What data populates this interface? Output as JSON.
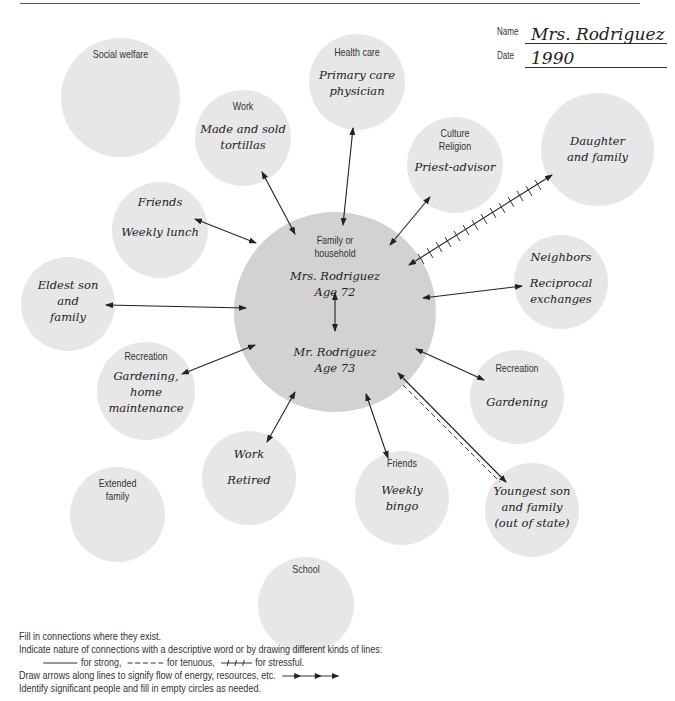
{
  "header": {
    "name_label": "Name",
    "name_value": "Mrs. Rodriguez",
    "date_label": "Date",
    "date_value": "1990"
  },
  "center": {
    "category": "Family or household",
    "person1_name": "Mrs. Rodriguez",
    "person1_age": "Age 72",
    "person2_name": "Mr. Rodriguez",
    "person2_age": "Age 73"
  },
  "circles": {
    "social_welfare": {
      "category": "Social welfare",
      "note": ""
    },
    "health_care": {
      "category": "Health care",
      "note_line1": "Primary care",
      "note_line2": "physician"
    },
    "work_past": {
      "category": "Work",
      "note_line1": "Made and sold",
      "note_line2": "tortillas"
    },
    "culture_religion": {
      "category_line1": "Culture",
      "category_line2": "Religion",
      "note": "Priest-advisor"
    },
    "daughter": {
      "note_line1": "Daughter",
      "note_line2": "and family"
    },
    "friends_lunch": {
      "category": "Friends",
      "note": "Weekly lunch"
    },
    "eldest_son": {
      "note_line1": "Eldest son",
      "note_line2": "and",
      "note_line3": "family"
    },
    "neighbors": {
      "category": "Neighbors",
      "note_line1": "Reciprocal",
      "note_line2": "exchanges"
    },
    "recreation_home": {
      "category": "Recreation",
      "note_line1": "Gardening,",
      "note_line2": "home",
      "note_line3": "maintenance"
    },
    "recreation_garden": {
      "category": "Recreation",
      "note": "Gardening"
    },
    "work_retired": {
      "category": "Work",
      "note": "Retired"
    },
    "extended_family": {
      "category_line1": "Extended",
      "category_line2": "family"
    },
    "friends_bingo": {
      "category": "Friends",
      "note_line1": "Weekly",
      "note_line2": "bingo"
    },
    "youngest_son": {
      "note_line1": "Youngest son",
      "note_line2": "and family",
      "note_line3": "(out of state)"
    },
    "school": {
      "category": "School"
    }
  },
  "connections": [
    {
      "to": "health_care",
      "type": "strong",
      "arrows": "both"
    },
    {
      "to": "work_past",
      "type": "strong",
      "arrows": "both"
    },
    {
      "to": "culture_religion",
      "type": "strong",
      "arrows": "both"
    },
    {
      "to": "daughter",
      "type": "stressful",
      "arrows": "both"
    },
    {
      "to": "friends_lunch",
      "type": "strong",
      "arrows": "both"
    },
    {
      "to": "eldest_son",
      "type": "strong",
      "arrows": "both"
    },
    {
      "to": "neighbors",
      "type": "strong",
      "arrows": "both"
    },
    {
      "to": "recreation_home",
      "type": "strong",
      "arrows": "both"
    },
    {
      "to": "recreation_garden",
      "type": "strong",
      "arrows": "both"
    },
    {
      "to": "work_retired",
      "type": "strong",
      "arrows": "both"
    },
    {
      "to": "friends_bingo",
      "type": "strong",
      "arrows": "both"
    },
    {
      "to": "youngest_son",
      "type": "strong+tenuous",
      "arrows": "both"
    },
    {
      "between": "Mrs. Rodriguez–Mr. Rodriguez",
      "type": "strong",
      "arrows": "both"
    }
  ],
  "footer": {
    "line1": "Fill in connections where they exist.",
    "line2": "Indicate nature of connections with a descriptive word or by drawing different kinds of lines:",
    "legend_strong": "for strong,",
    "legend_tenuous": "for tenuous,",
    "legend_stressful": "for stressful.",
    "line4": "Draw arrows along lines to signify flow of energy, resources, etc.",
    "line5": "Identify significant people and fill in empty circles as needed."
  },
  "colors": {
    "outer_circle": "#e7e7e7",
    "center_circle": "#d2d2d2",
    "line": "#222222"
  }
}
